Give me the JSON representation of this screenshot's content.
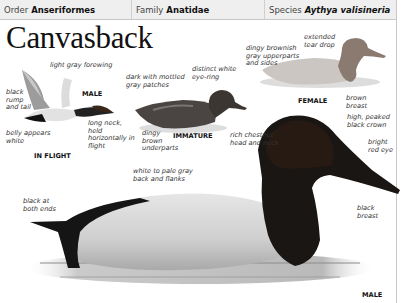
{
  "header": {
    "order_label": "Order",
    "order_value": "Anseriformes",
    "family_label": "Family",
    "family_value": "Anatidae",
    "species_label": "Species",
    "species_value": "Aythya valisineria"
  },
  "title": "Canvasback",
  "in_flight": {
    "caption": "IN FLIGHT",
    "sex": "MALE",
    "labels": {
      "forewing": "light gray forewing",
      "rump": "black rump and tail",
      "belly": "belly appears white",
      "neck": "long neck, held horizontally in flight"
    }
  },
  "immature": {
    "caption": "IMMATURE",
    "labels": {
      "patches": "dark with mottled gray patches",
      "eye_ring": "distinct white eye-ring",
      "underparts": "dingy brown underparts"
    }
  },
  "female": {
    "caption": "FEMALE",
    "labels": {
      "upperparts": "dingy brownish gray upperparts and sides",
      "tear_drop": "extended tear drop",
      "breast": "brown breast"
    }
  },
  "male": {
    "caption": "MALE",
    "labels": {
      "head": "rich chestnut head and neck",
      "crown": "high, peaked black crown",
      "eye": "bright red eye",
      "back": "white to pale gray back and flanks",
      "ends": "black at both ends",
      "breast": "black breast"
    }
  },
  "colors": {
    "header_bg": "#efefef",
    "border": "#c8c8c8",
    "text": "#111111",
    "label_text": "#333333"
  }
}
